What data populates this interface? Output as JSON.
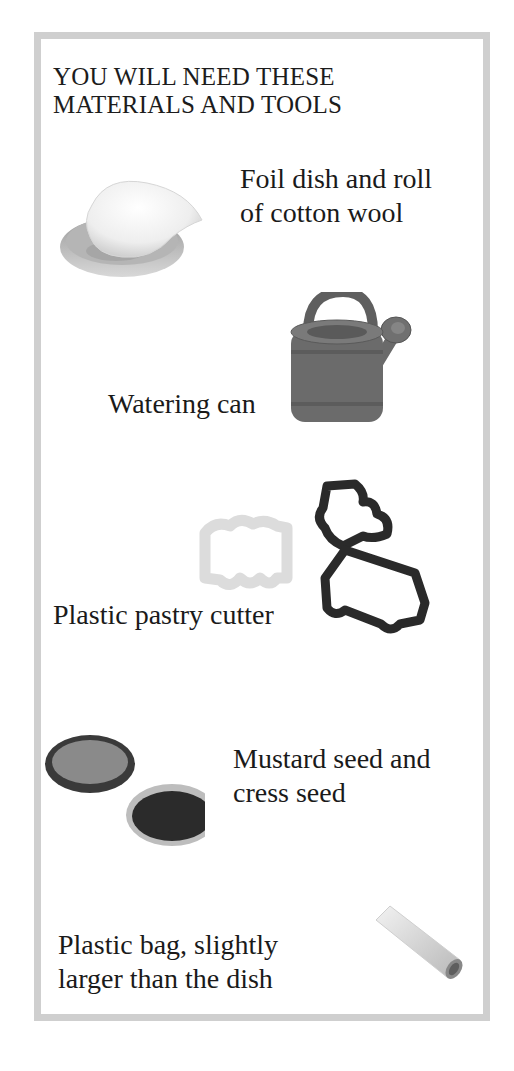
{
  "page": {
    "heading_line1": "YOU WILL NEED THESE",
    "heading_line2": "MATERIALS AND TOOLS",
    "border_color": "#cfcfcf"
  },
  "items": [
    {
      "line1": "Foil dish and roll",
      "line2": "of cotton wool",
      "icon": "foil-dish-cotton-wool-icon"
    },
    {
      "line1": "Watering can",
      "line2": "",
      "icon": "watering-can-icon"
    },
    {
      "line1": "Plastic pastry cutter",
      "line2": "",
      "icon": "pastry-cutters-icon"
    },
    {
      "line1": "Mustard seed and",
      "line2": "cress seed",
      "icon": "seed-dishes-icon"
    },
    {
      "line1": "Plastic bag, slightly",
      "line2": "larger than the dish",
      "icon": "plastic-bag-roll-icon"
    }
  ]
}
